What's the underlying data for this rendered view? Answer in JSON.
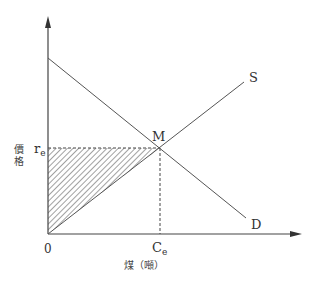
{
  "diagram": {
    "y_axis_label": [
      "價",
      "格"
    ],
    "x_axis_label": "煤（噸）",
    "origin_label": "0",
    "price_label": "r",
    "price_subscript": "e",
    "quantity_label": "C",
    "quantity_subscript": "e",
    "equilibrium_label": "M",
    "supply_label": "S",
    "demand_label": "D",
    "colors": {
      "line": "#555555",
      "axis": "#444444",
      "text": "#333333"
    }
  }
}
